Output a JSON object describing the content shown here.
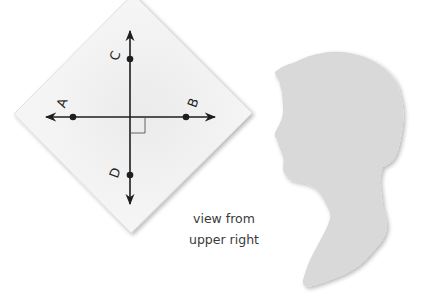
{
  "diagram": {
    "paper": {
      "shape": "diamond",
      "vertices": [
        [
          133,
          -6
        ],
        [
          252,
          113
        ],
        [
          131,
          233
        ],
        [
          14,
          114
        ]
      ],
      "fill": "#f3f3f3",
      "edge": "#e2e2e2"
    },
    "lines": {
      "horizontal": {
        "label": "line AB",
        "from": [
          44,
          117
        ],
        "to": [
          217,
          117
        ],
        "arrows": "both"
      },
      "vertical": {
        "label": "line CD",
        "from": [
          130,
          29
        ],
        "to": [
          130,
          206
        ],
        "arrows": "both"
      },
      "right_angle_marker": {
        "x": 130,
        "y": 117,
        "size": 15
      }
    },
    "points": [
      {
        "name": "A",
        "x": 73,
        "y": 117,
        "label_x": 63,
        "label_y": 103
      },
      {
        "name": "B",
        "x": 186,
        "y": 117,
        "label_x": 194,
        "label_y": 103
      },
      {
        "name": "C",
        "x": 130,
        "y": 59,
        "label_x": 116,
        "label_y": 56
      },
      {
        "name": "D",
        "x": 130,
        "y": 175,
        "label_x": 116,
        "label_y": 173
      }
    ],
    "line_color": "#1e1e1e"
  },
  "silhouette": {
    "description": "head profile silhouette facing left",
    "fill": "#d9d9d9"
  },
  "caption": {
    "line1": "view from",
    "line2": "upper right"
  }
}
